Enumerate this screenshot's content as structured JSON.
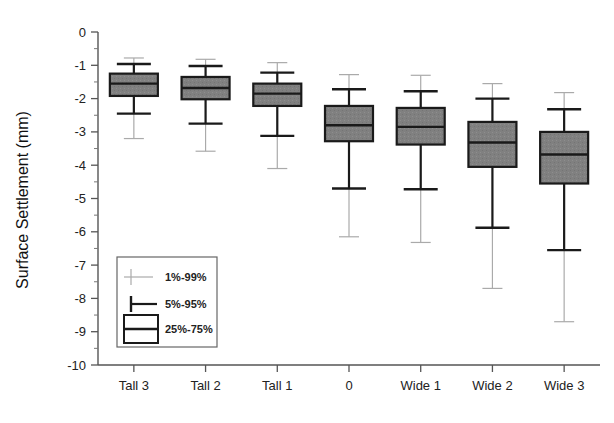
{
  "chart_data": {
    "type": "box",
    "title": "",
    "xlabel": "",
    "ylabel": "Surface Settlement (mm)",
    "ylim": [
      -10,
      0
    ],
    "ytick_labels": [
      "0",
      "-1",
      "-2",
      "-3",
      "-4",
      "-5",
      "-6",
      "-7",
      "-8",
      "-9",
      "-10"
    ],
    "ytick_values": [
      0,
      -1,
      -2,
      -3,
      -4,
      -5,
      -6,
      -7,
      -8,
      -9,
      -10
    ],
    "yminor_step": 0.5,
    "grid": false,
    "categories": [
      "Tall 3",
      "Tall 2",
      "Tall 1",
      "0",
      "Wide 1",
      "Wide 2",
      "Wide 3"
    ],
    "legend_position": "inside-lower-left",
    "legend": [
      {
        "key": "p1_99",
        "label": "1%-99%",
        "glyph": "thin-line"
      },
      {
        "key": "p5_95",
        "label": "5%-95%",
        "glyph": "whisker"
      },
      {
        "key": "p25_75",
        "label": "25%-75%",
        "glyph": "box"
      }
    ],
    "box_fill_color": "#808080",
    "box_edge_color": "#1a1a1a",
    "outer_line_color": "#aaaaaa",
    "boxes": [
      {
        "category": "Tall 3",
        "p1": -0.78,
        "p5": -0.96,
        "p25": -1.25,
        "median": -1.55,
        "p75": -1.92,
        "p95": -2.45,
        "p99": -3.2
      },
      {
        "category": "Tall 2",
        "p1": -0.82,
        "p5": -1.02,
        "p25": -1.35,
        "median": -1.68,
        "p75": -2.02,
        "p95": -2.75,
        "p99": -3.58
      },
      {
        "category": "Tall 1",
        "p1": -0.92,
        "p5": -1.22,
        "p25": -1.55,
        "median": -1.85,
        "p75": -2.22,
        "p95": -3.12,
        "p99": -4.1
      },
      {
        "category": "0",
        "p1": -1.28,
        "p5": -1.72,
        "p25": -2.22,
        "median": -2.8,
        "p75": -3.28,
        "p95": -4.7,
        "p99": -6.15
      },
      {
        "category": "Wide 1",
        "p1": -1.3,
        "p5": -1.78,
        "p25": -2.28,
        "median": -2.85,
        "p75": -3.38,
        "p95": -4.72,
        "p99": -6.32
      },
      {
        "category": "Wide 2",
        "p1": -1.55,
        "p5": -2.0,
        "p25": -2.7,
        "median": -3.32,
        "p75": -4.05,
        "p95": -5.88,
        "p99": -7.7
      },
      {
        "category": "Wide 3",
        "p1": -1.82,
        "p5": -2.32,
        "p25": -3.0,
        "median": -3.68,
        "p75": -4.55,
        "p95": -6.55,
        "p99": -8.7
      }
    ]
  }
}
